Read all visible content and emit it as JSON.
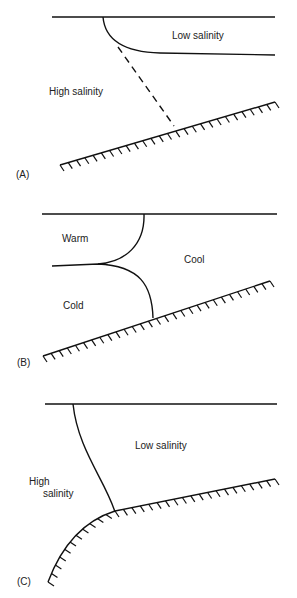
{
  "panels": {
    "a": {
      "tag": "(A)",
      "low": "Low salinity",
      "high": "High salinity"
    },
    "b": {
      "tag": "(B)",
      "warm": "Warm",
      "cool": "Cool",
      "cold": "Cold"
    },
    "c": {
      "tag": "(C)",
      "low": "Low salinity",
      "high1": "High",
      "high2": "salinity"
    }
  },
  "colors": {
    "line": "#111111",
    "text": "#222222",
    "background": "#ffffff"
  }
}
